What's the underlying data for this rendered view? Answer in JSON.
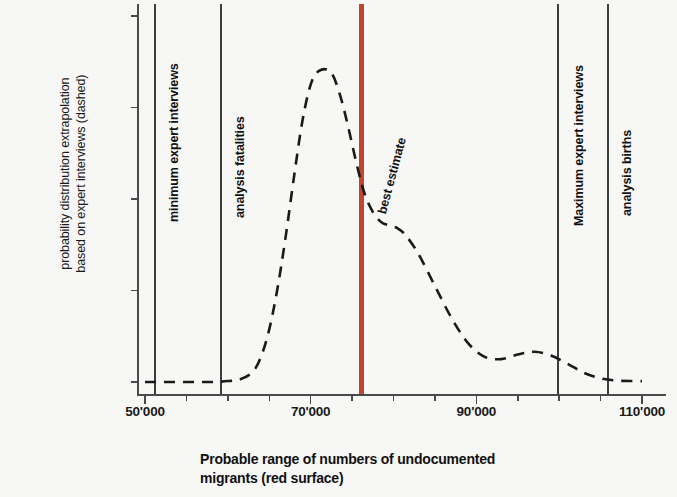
{
  "chart_data": {
    "type": "line",
    "title": "",
    "xlabel": "Probable range of numbers of undocumented migrants (red surface)",
    "ylabel": "probability distribution  extrapolation based on expert interviews (dashed)",
    "ylabel_line1": "probability distribution  extrapolation",
    "ylabel_line2": "based on expert interviews (dashed)",
    "xlabel_line1": "Probable range of numbers of undocumented",
    "xlabel_line2": "migrants (red surface)",
    "xlim": [
      50000,
      110000
    ],
    "ylim": [
      0.0,
      0.008
    ],
    "grid": false,
    "legend": "none",
    "x_ticks_major": [
      "50'000",
      "70'000",
      "90'000",
      "110'000"
    ],
    "x_tick_major_values": [
      50000,
      70000,
      90000,
      110000
    ],
    "x_tick_minor_values": [
      55000,
      60000,
      65000,
      75000,
      80000,
      85000,
      95000,
      100000,
      105000
    ],
    "y_ticks": [
      "0.008%",
      "0.006%",
      "0.004%",
      "0.002%",
      "0.000%"
    ],
    "y_tick_values": [
      0.008,
      0.006,
      0.004,
      0.002,
      0.0
    ],
    "series": [
      {
        "name": "probability distribution (dashed)",
        "style": "dashed",
        "color": "#1a1a1a",
        "x": [
          50000,
          52000,
          54000,
          56000,
          58000,
          60000,
          61500,
          63000,
          64000,
          65000,
          66000,
          67000,
          68000,
          69000,
          70000,
          71000,
          72400,
          73500,
          74500,
          75500,
          76500,
          77500,
          78500,
          79500,
          80500,
          81500,
          83000,
          85000,
          87000,
          89000,
          91000,
          93000,
          95000,
          97000,
          99000,
          101000,
          103000,
          105000,
          107000,
          109000,
          110000
        ],
        "y": [
          0.0,
          0.0,
          0.0,
          0.0,
          0.0,
          2e-05,
          6e-05,
          0.00022,
          0.00055,
          0.00115,
          0.00205,
          0.0032,
          0.0045,
          0.0057,
          0.0065,
          0.0068,
          0.00678,
          0.0063,
          0.0056,
          0.0048,
          0.00412,
          0.00372,
          0.0035,
          0.00342,
          0.00336,
          0.0032,
          0.0028,
          0.0021,
          0.0014,
          0.00085,
          0.00055,
          0.0005,
          0.0006,
          0.00066,
          0.00058,
          0.0004,
          0.0002,
          8e-05,
          3e-05,
          2e-05,
          2e-05
        ]
      }
    ],
    "markers": [
      {
        "id": "minimum-expert-interviews",
        "label": "minimum expert interviews",
        "value": 51200,
        "color": "#3d3d3d",
        "kind": "vertical-line"
      },
      {
        "id": "analysis-fatalities",
        "label": "analysis fatalities",
        "value": 59200,
        "color": "#3d3d3d",
        "kind": "vertical-line"
      },
      {
        "id": "best-estimate",
        "label": "best estimate",
        "value": 76100,
        "color": "#c2452f",
        "kind": "vertical-band"
      },
      {
        "id": "maximum-expert-interviews",
        "label": "Maximum expert interviews",
        "value": 99900,
        "color": "#3d3d3d",
        "kind": "vertical-line"
      },
      {
        "id": "analysis-births",
        "label": "analysis births",
        "value": 105900,
        "color": "#3d3d3d",
        "kind": "vertical-line"
      }
    ]
  }
}
